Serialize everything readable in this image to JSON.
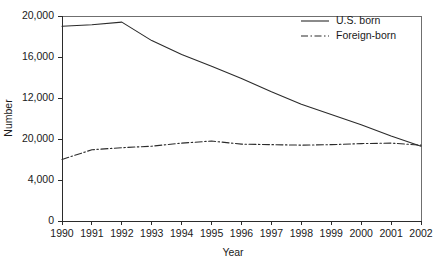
{
  "chart_data": {
    "type": "line",
    "title": "",
    "xlabel": "Year",
    "ylabel": "Number",
    "x": [
      1990,
      1991,
      1992,
      1993,
      1994,
      1995,
      1996,
      1997,
      1998,
      1999,
      2000,
      2001,
      2002
    ],
    "categories": [
      "1990",
      "1991",
      "1992",
      "1993",
      "1994",
      "1995",
      "1996",
      "1997",
      "1998",
      "1999",
      "2000",
      "2001",
      "2002"
    ],
    "xlim": [
      1990,
      2002
    ],
    "ylim": [
      0,
      20000
    ],
    "ytick_labels": [
      "0",
      "4,000",
      "20,000",
      "12,000",
      "16,000",
      "20,000"
    ],
    "ytick_values": [
      0,
      4000,
      8000,
      12000,
      16000,
      20000
    ],
    "grid": false,
    "legend_position": "top-right",
    "series": [
      {
        "name": "U.S. born",
        "style": "solid",
        "color": "#2b2b2b",
        "values": [
          19000,
          19150,
          19400,
          17600,
          16250,
          15100,
          13900,
          12600,
          11400,
          10400,
          9400,
          8300,
          7300
        ]
      },
      {
        "name": "Foreign-born",
        "style": "dash-dot",
        "color": "#2b2b2b",
        "values": [
          6000,
          6950,
          7150,
          7300,
          7600,
          7800,
          7500,
          7450,
          7400,
          7450,
          7550,
          7600,
          7400
        ]
      }
    ]
  }
}
